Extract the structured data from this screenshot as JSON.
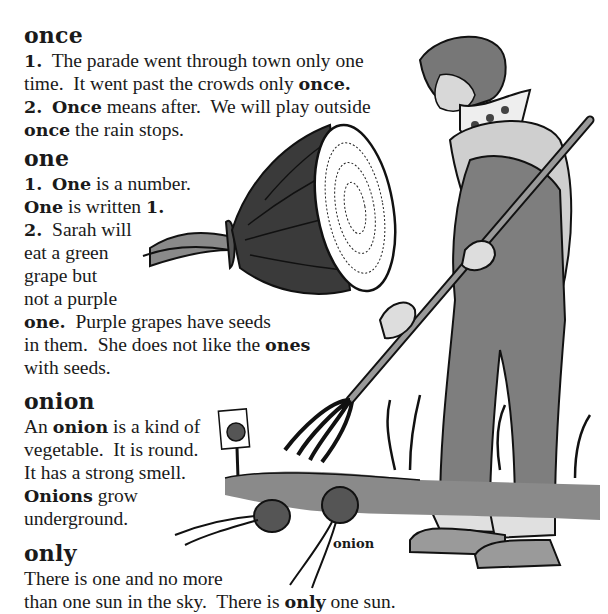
{
  "entries": [
    {
      "headword": "once",
      "lines": [
        [
          {
            "t": "1.",
            "b": true
          },
          {
            "t": "  The parade went through town only one"
          }
        ],
        [
          {
            "t": "time.  It went past the crowds only "
          },
          {
            "t": "once.",
            "b": true
          }
        ],
        [
          {
            "t": "2.",
            "b": true
          },
          {
            "t": "  "
          },
          {
            "t": "Once",
            "b": true
          },
          {
            "t": " means after.  We will play outside"
          }
        ],
        [
          {
            "t": "once",
            "b": true
          },
          {
            "t": " the rain stops."
          }
        ]
      ]
    },
    {
      "headword": "one",
      "lines": [
        [
          {
            "t": "1.",
            "b": true
          },
          {
            "t": "  "
          },
          {
            "t": "One",
            "b": true
          },
          {
            "t": " is a number."
          }
        ],
        [
          {
            "t": "One",
            "b": true
          },
          {
            "t": " is written "
          },
          {
            "t": "1.",
            "b": true
          }
        ],
        [
          {
            "t": "2.",
            "b": true
          },
          {
            "t": "  Sarah will"
          }
        ],
        [
          {
            "t": "eat a green"
          }
        ],
        [
          {
            "t": "grape but"
          }
        ],
        [
          {
            "t": "not a purple"
          }
        ],
        [
          {
            "t": "one.",
            "b": true
          },
          {
            "t": "  Purple grapes have seeds"
          }
        ],
        [
          {
            "t": "in them.  She does not like the "
          },
          {
            "t": "ones",
            "b": true
          }
        ],
        [
          {
            "t": "with seeds."
          }
        ]
      ]
    },
    {
      "headword": "onion",
      "lines": [
        [
          {
            "t": "An "
          },
          {
            "t": "onion",
            "b": true
          },
          {
            "t": " is a kind of"
          }
        ],
        [
          {
            "t": "vegetable.  It is round."
          }
        ],
        [
          {
            "t": "It has a strong smell."
          }
        ],
        [
          {
            "t": "Onions",
            "b": true
          },
          {
            "t": " grow"
          }
        ],
        [
          {
            "t": "underground."
          }
        ]
      ]
    },
    {
      "headword": "only",
      "lines": [
        [
          {
            "t": "There is one and no more"
          }
        ],
        [
          {
            "t": "than one sun in the sky.  There is "
          },
          {
            "t": "only",
            "b": true
          },
          {
            "t": " one sun."
          }
        ]
      ]
    }
  ],
  "illustrations": {
    "cut_onion": "halved-onion-icon",
    "gardener": "gardener-with-pitchfork-icon",
    "garden_onions": "onions-in-ground-icon",
    "caption": "onion"
  },
  "layout": {
    "entry_tops": [
      22,
      145,
      388,
      540
    ],
    "line_height": 23
  }
}
